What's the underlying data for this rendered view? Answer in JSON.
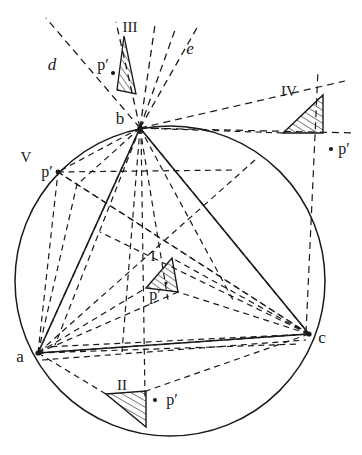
{
  "figure": {
    "type": "geometry-diagram",
    "background": "#ffffff",
    "stroke_color": "#1a1a1a",
    "circle": {
      "cx": 170,
      "cy": 281,
      "r": 155
    },
    "vertices": [
      {
        "id": "a",
        "label": "a",
        "x": 38,
        "y": 353,
        "label_x": 20,
        "label_y": 362
      },
      {
        "id": "b",
        "label": "b",
        "x": 140,
        "y": 128,
        "label_x": 118,
        "label_y": 123
      },
      {
        "id": "c",
        "label": "c",
        "x": 309,
        "y": 334,
        "label_x": 320,
        "label_y": 343
      }
    ],
    "ray_labels": [
      {
        "id": "d",
        "label": "d",
        "x": 52,
        "y": 67
      },
      {
        "id": "e",
        "label": "e",
        "x": 188,
        "y": 52
      }
    ],
    "region_labels": [
      {
        "id": "I",
        "label": "I",
        "x": 152,
        "y": 256
      },
      {
        "id": "II",
        "label": "II",
        "x": 120,
        "y": 389
      },
      {
        "id": "III",
        "label": "III",
        "x": 127,
        "y": 30
      },
      {
        "id": "IV",
        "label": "IV",
        "x": 287,
        "y": 93
      },
      {
        "id": "V",
        "label": "V",
        "x": 24,
        "y": 158
      }
    ],
    "p_prime_labels": [
      {
        "region": "III",
        "label": "p′",
        "x": 98,
        "y": 68,
        "dot_x": 113,
        "dot_y": 73,
        "dot": true
      },
      {
        "region": "IV",
        "label": "p′",
        "x": 340,
        "y": 153,
        "dot_x": 331,
        "dot_y": 149,
        "dot": true
      },
      {
        "region": "V",
        "label": "p′",
        "x": 45,
        "y": 176,
        "dot_x": 0,
        "dot_y": 0,
        "dot": false
      },
      {
        "region": "I",
        "label": "p′",
        "x": 152,
        "y": 295,
        "dot_x": 0,
        "dot_y": 0,
        "dot": false
      },
      {
        "region": "II",
        "label": "p′",
        "x": 168,
        "y": 403,
        "dot_x": 155,
        "dot_y": 400,
        "dot": true
      }
    ],
    "hatched_triangles": [
      {
        "region": "I",
        "points": "146,288 172,258 178,292"
      },
      {
        "region": "II",
        "points": "106,394 146,391 146,427"
      },
      {
        "region": "III",
        "points": "123,38 134,96 116,92"
      },
      {
        "region": "IV",
        "points": "283,133 323,95 323,133"
      }
    ]
  }
}
